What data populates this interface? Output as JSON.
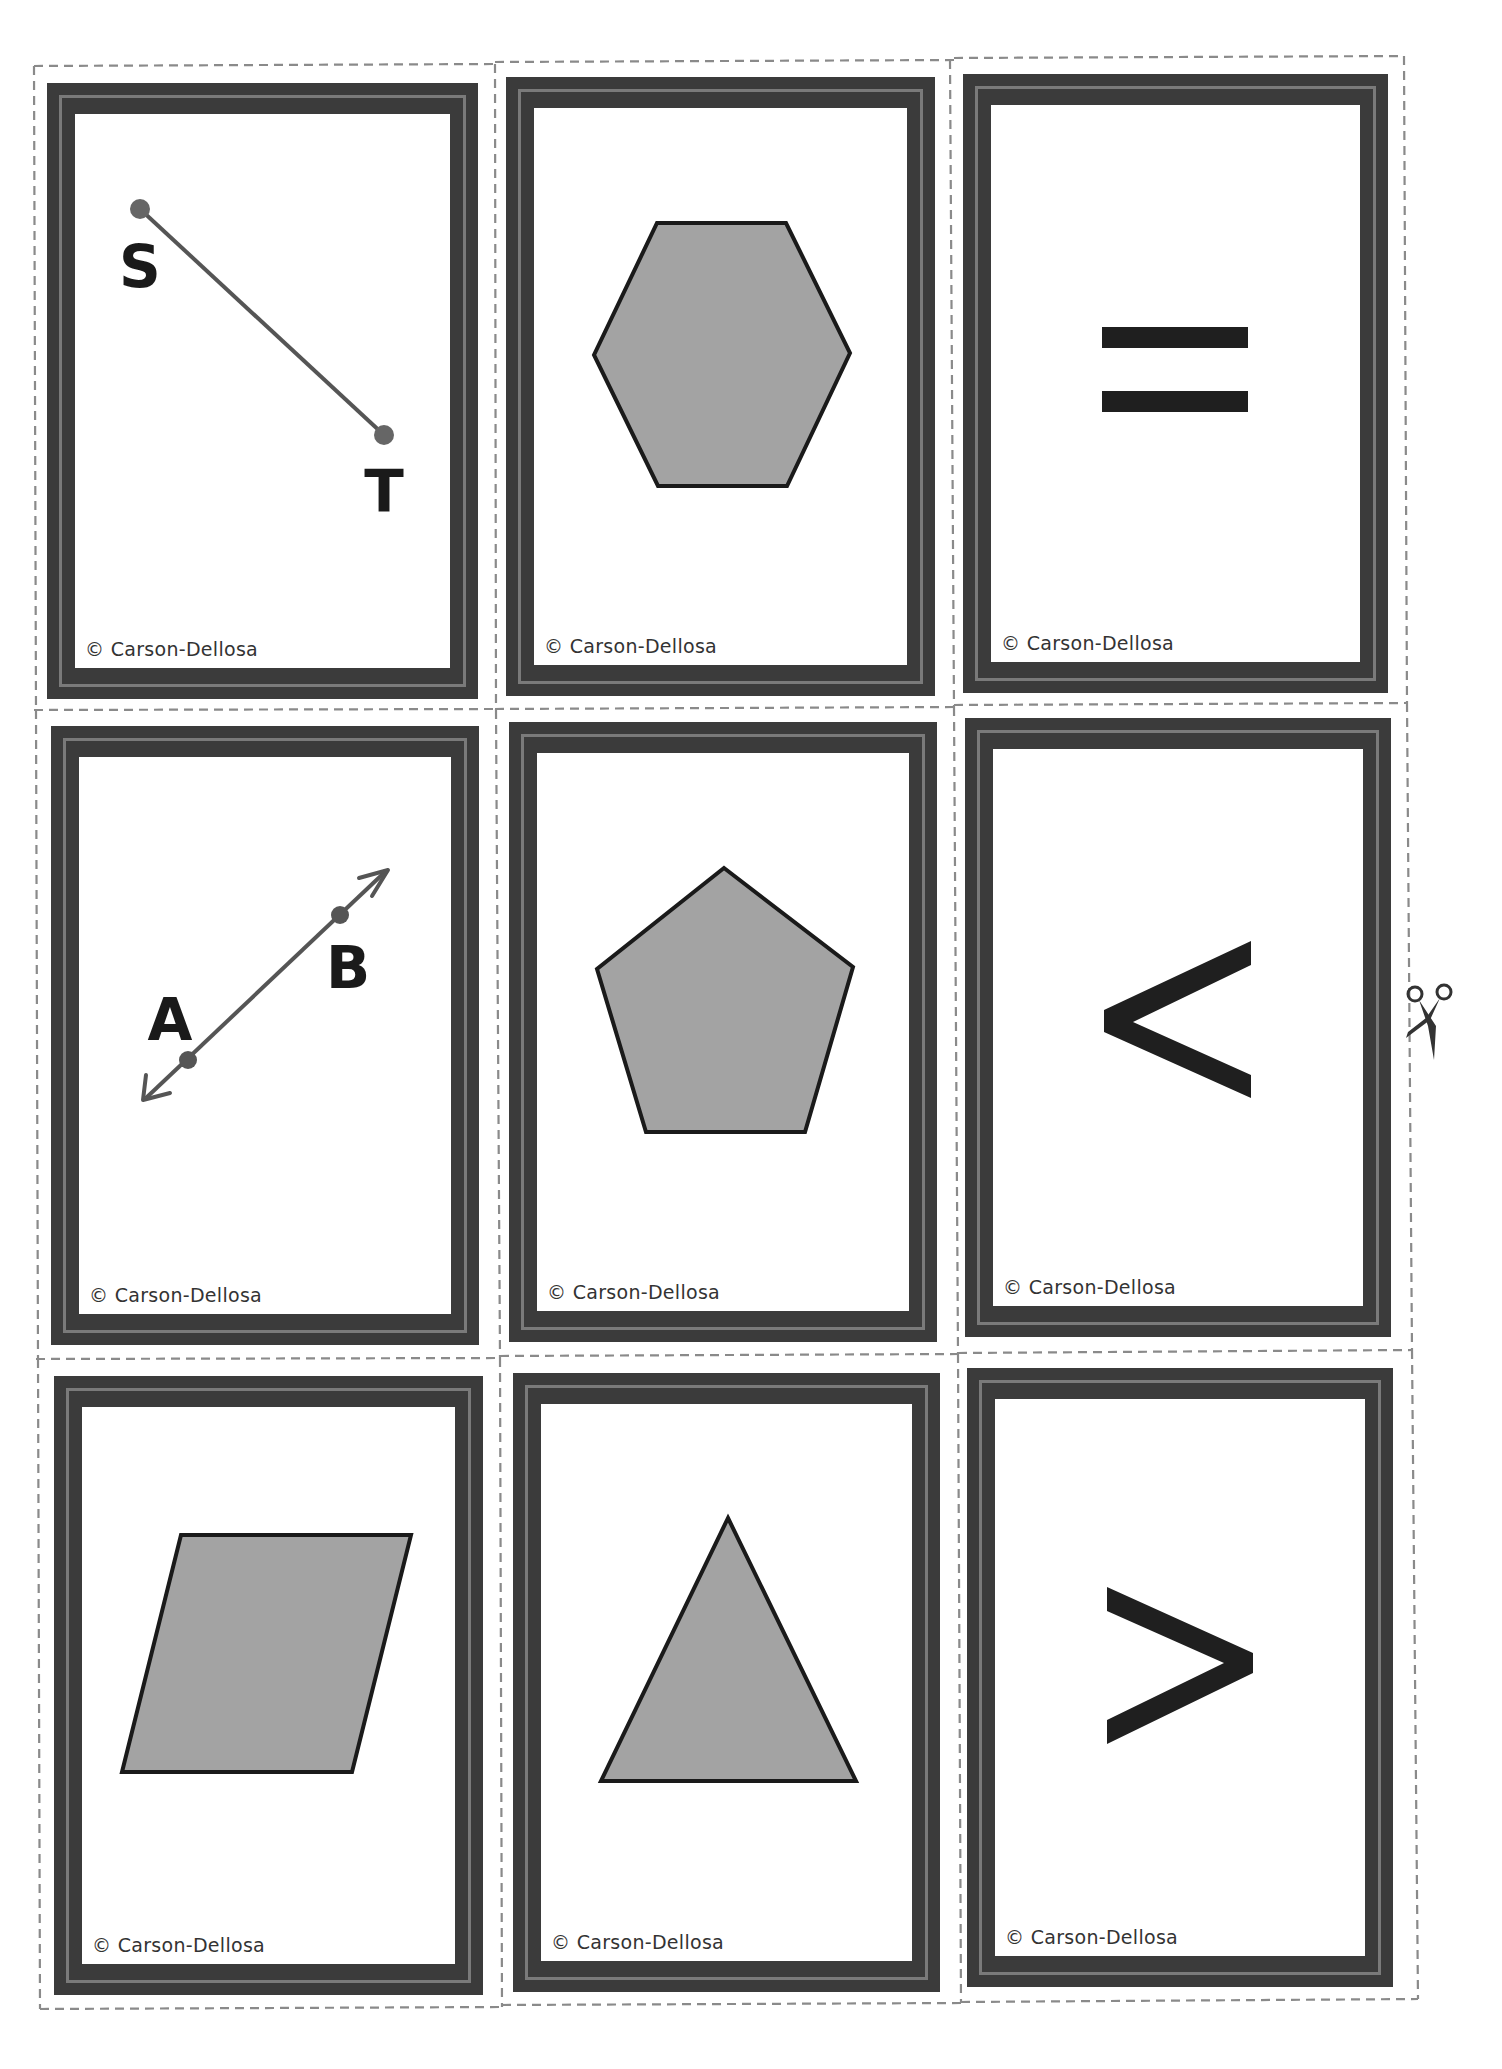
{
  "sheet": {
    "title": "Geometry & comparison symbol flash cards",
    "cut_icon": "scissors-icon",
    "colors": {
      "frame_dark": "#3b3b3b",
      "frame_light": "#7a7a7a",
      "shape_fill": "#a3a3a3",
      "shape_stroke": "#1a1a1a",
      "symbol": "#1f1f1f",
      "cut_line": "#8a8a8a"
    }
  },
  "cards": [
    {
      "id": 1,
      "content": "line-segment",
      "labels": [
        "S",
        "T"
      ],
      "credit": "© Carson-Dellosa"
    },
    {
      "id": 2,
      "content": "hexagon",
      "credit": "© Carson-Dellosa"
    },
    {
      "id": 3,
      "content": "equals-sign",
      "symbol": "=",
      "credit": "© Carson-Dellosa"
    },
    {
      "id": 4,
      "content": "line",
      "labels": [
        "A",
        "B"
      ],
      "credit": "© Carson-Dellosa"
    },
    {
      "id": 5,
      "content": "pentagon",
      "credit": "© Carson-Dellosa"
    },
    {
      "id": 6,
      "content": "less-than-sign",
      "symbol": "<",
      "credit": "© Carson-Dellosa"
    },
    {
      "id": 7,
      "content": "parallelogram",
      "credit": "© Carson-Dellosa"
    },
    {
      "id": 8,
      "content": "triangle",
      "credit": "© Carson-Dellosa"
    },
    {
      "id": 9,
      "content": "greater-than-sign",
      "symbol": ">",
      "credit": "© Carson-Dellosa"
    }
  ]
}
